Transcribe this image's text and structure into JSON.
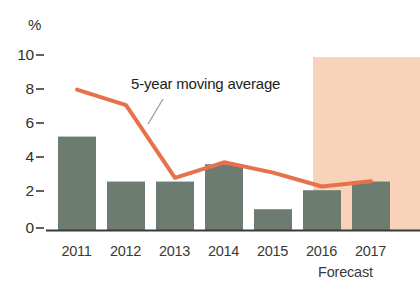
{
  "chart_data": {
    "type": "bar",
    "title": "",
    "subtitle": "",
    "xlabel": "",
    "ylabel": "%",
    "categories": [
      "2011",
      "2012",
      "2013",
      "2014",
      "2015",
      "2016",
      "2017"
    ],
    "values": [
      5.4,
      2.8,
      2.8,
      3.8,
      1.2,
      2.3,
      2.8
    ],
    "series": [
      {
        "name": "Annual value",
        "type": "bar",
        "values": [
          5.4,
          2.8,
          2.8,
          3.8,
          1.2,
          2.3,
          2.8
        ]
      },
      {
        "name": "5-year moving average",
        "type": "line",
        "values": [
          8.0,
          7.1,
          2.9,
          3.8,
          3.2,
          2.4,
          2.7
        ]
      }
    ],
    "ylim": [
      0,
      10
    ],
    "yticks": [
      0,
      2,
      4,
      6,
      8,
      10
    ],
    "ytick_labels": [
      "0",
      "2",
      "4",
      "6",
      "8",
      "10"
    ],
    "grid": false,
    "legend": "none",
    "annotations": [
      {
        "text": "5-year moving average",
        "target_category": "2013"
      },
      {
        "text": "Forecast",
        "target_categories": [
          "2016",
          "2017"
        ]
      }
    ],
    "shaded_regions": [
      {
        "label": "Forecast",
        "from": "2016",
        "to": "2017",
        "color": "#f8d3ba"
      }
    ],
    "colors": {
      "bar": "#6d7c70",
      "line": "#e8704a",
      "forecast_band": "#f8d3ba",
      "axis": "#3a3a3a",
      "leader": "#9a9a9a"
    }
  },
  "axis": {
    "unit_label": "%"
  },
  "annotations": {
    "moving_average_label": "5-year moving average",
    "forecast_label": "Forecast"
  }
}
